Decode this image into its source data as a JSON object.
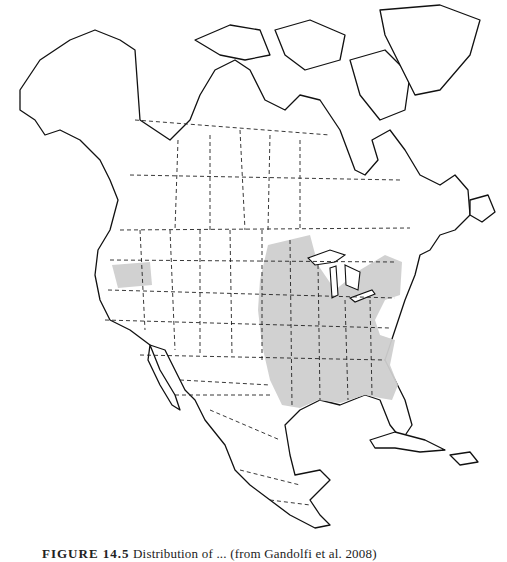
{
  "figure": {
    "caption_label": "FIGURE 14.5",
    "caption_text": "Distribution of ... (from Gandolfi et al. 2008)",
    "caption_note": "caption partially cropped at bottom edge; exact wording not fully legible"
  },
  "map": {
    "region": "North America",
    "style": "black-and-white outline map with dashed state/province borders",
    "shaded_regions": [
      {
        "name": "eastern-range",
        "description": "Central and eastern United States from the Great Plains and upper Midwest to the Atlantic coast and Gulf coast, including Florida",
        "color": "#cfcfcf"
      },
      {
        "name": "western-range",
        "description": "Northern California / Oregon area along Pacific coast",
        "color": "#cfcfcf"
      }
    ],
    "colors": {
      "outline": "#111111",
      "shading": "#cfcfcf",
      "background": "#ffffff"
    }
  }
}
